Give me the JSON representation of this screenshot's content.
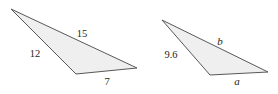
{
  "figure": {
    "colors": {
      "fill": "#efefef",
      "stroke": "#58585a",
      "text": "#231f20",
      "background": "#ffffff"
    },
    "triangles": [
      {
        "id": "left-triangle",
        "name": "known-triangle",
        "vertices": [
          {
            "name": "apex",
            "x": 11,
            "y": 9
          },
          {
            "name": "bottom-right",
            "x": 137,
            "y": 68
          },
          {
            "name": "bottom-left",
            "x": 76,
            "y": 74
          }
        ],
        "labels": [
          {
            "id": "label-15",
            "text": "15",
            "side": "apex-to-bottom-right",
            "x": 82,
            "y": 37
          },
          {
            "id": "label-12",
            "text": "12",
            "side": "apex-to-bottom-left",
            "x": 35,
            "y": 57
          },
          {
            "id": "label-7",
            "text": "7",
            "side": "bottom-left-to-bottom-right",
            "x": 107,
            "y": 85
          }
        ]
      },
      {
        "id": "right-triangle",
        "name": "unknown-triangle",
        "vertices": [
          {
            "name": "apex",
            "x": 162,
            "y": 20
          },
          {
            "name": "bottom-right",
            "x": 268,
            "y": 72
          },
          {
            "name": "bottom-left",
            "x": 210,
            "y": 75
          }
        ],
        "labels": [
          {
            "id": "label-b",
            "text": "b",
            "side": "apex-to-bottom-right",
            "x": 220,
            "y": 45,
            "italic": true
          },
          {
            "id": "label-9-6",
            "text": "9.6",
            "side": "apex-to-bottom-left",
            "x": 171,
            "y": 58
          },
          {
            "id": "label-a",
            "text": "a",
            "side": "bottom-left-to-bottom-right",
            "x": 237,
            "y": 85,
            "italic": true
          }
        ]
      }
    ]
  }
}
